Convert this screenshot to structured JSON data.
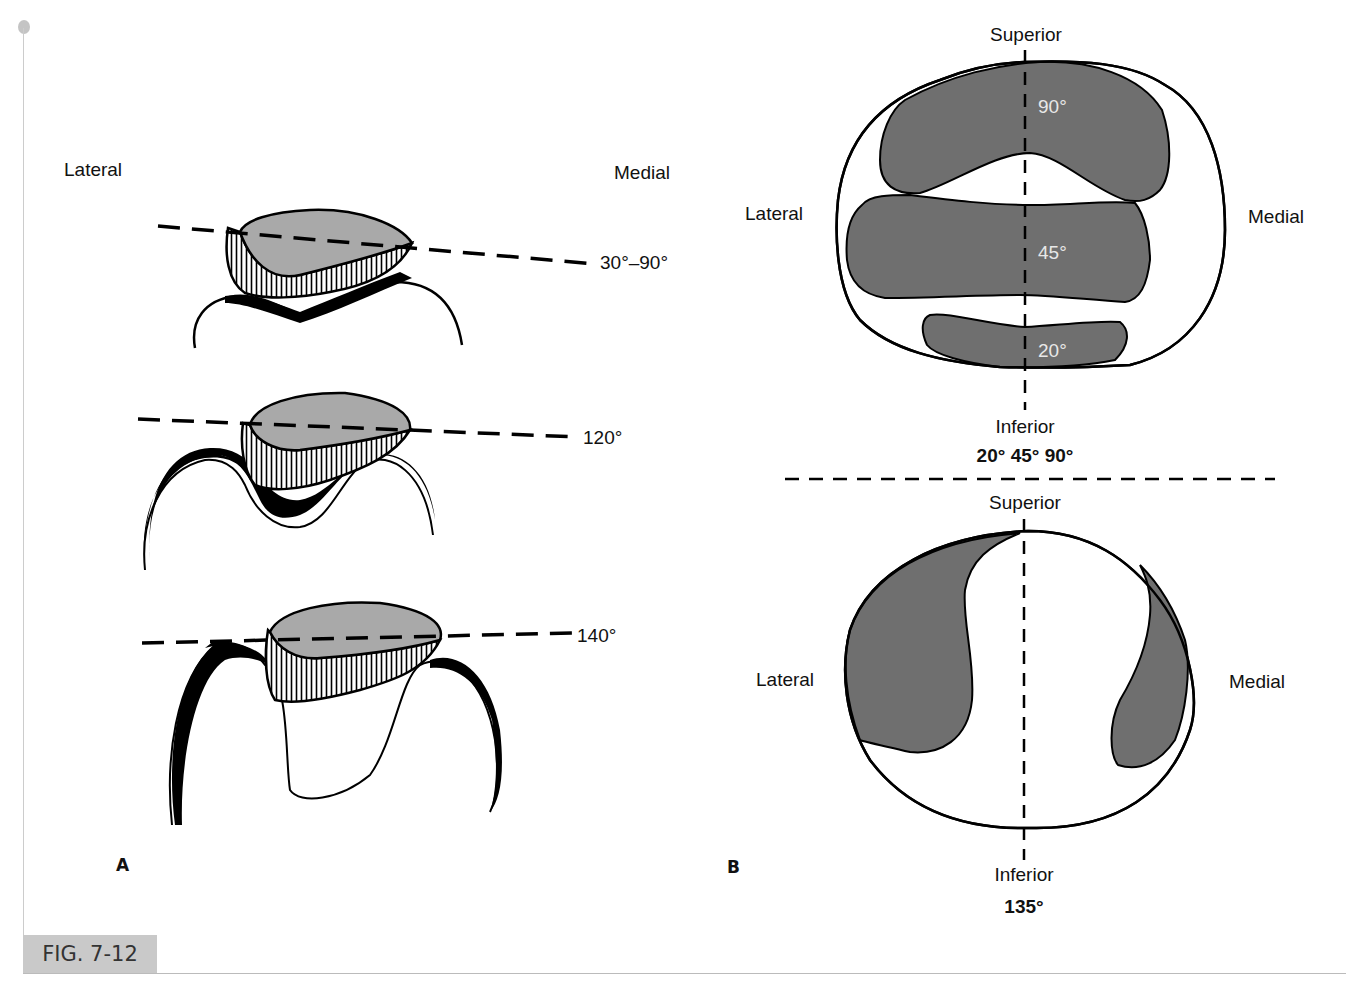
{
  "figure": {
    "tag": "FIG. 7-12",
    "colors": {
      "patella_fill": "#a9a9a9",
      "contact_fill": "#6f6f6f",
      "stroke": "#000000",
      "tag_bg": "#c9c9c9"
    }
  },
  "panel_a": {
    "letter": "A",
    "orientation": {
      "left": "Lateral",
      "right": "Medial"
    },
    "positions": [
      {
        "angle_label": "30°–90°"
      },
      {
        "angle_label": "120°"
      },
      {
        "angle_label": "140°"
      }
    ]
  },
  "panel_b": {
    "letter": "B",
    "top_diagram": {
      "superior": "Superior",
      "inferior": "Inferior",
      "lateral": "Lateral",
      "medial": "Medial",
      "zones": [
        {
          "label": "90°"
        },
        {
          "label": "45°"
        },
        {
          "label": "20°"
        }
      ],
      "caption": "20° 45° 90°"
    },
    "bottom_diagram": {
      "superior": "Superior",
      "inferior": "Inferior",
      "lateral": "Lateral",
      "medial": "Medial",
      "caption": "135°"
    }
  }
}
